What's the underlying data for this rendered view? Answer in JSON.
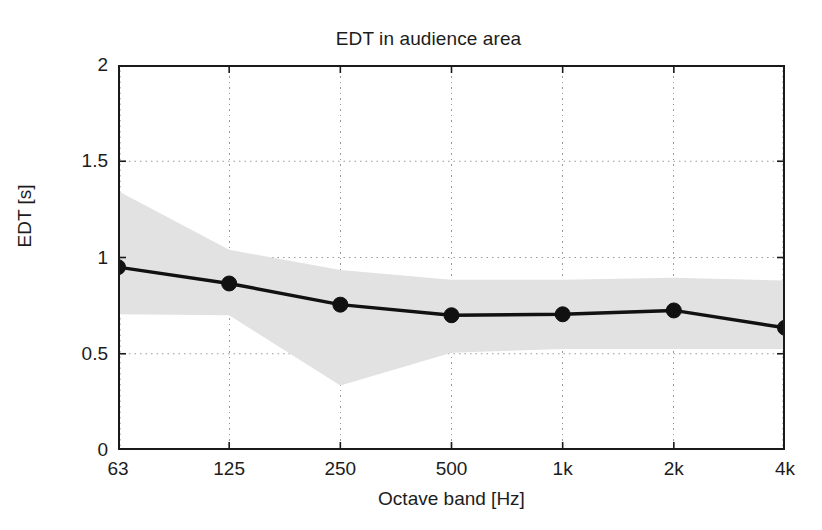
{
  "chart_data": {
    "type": "line",
    "title": "EDT in audience area",
    "xlabel": "Octave band [Hz]",
    "ylabel": "EDT [s]",
    "categories": [
      "63",
      "125",
      "250",
      "500",
      "1k",
      "2k",
      "4k"
    ],
    "x_tick_labels": [
      "63",
      "125",
      "250",
      "500",
      "1k",
      "2k",
      "4k"
    ],
    "y_tick_labels": [
      "0",
      "0.5",
      "1",
      "1.5",
      "2"
    ],
    "y_tick_values": [
      0,
      0.5,
      1,
      1.5,
      2
    ],
    "ylim": [
      0,
      2
    ],
    "grid": "dotted",
    "legend": "none",
    "series": [
      {
        "name": "EDT mean",
        "marker": "filled-circle",
        "color": "#111111",
        "values": [
          0.95,
          0.865,
          0.755,
          0.7,
          0.705,
          0.725,
          0.635
        ]
      }
    ],
    "band": {
      "name": "standard deviation range",
      "color": "#e2e2e2",
      "upper": [
        1.345,
        1.04,
        0.935,
        0.885,
        0.885,
        0.895,
        0.88
      ],
      "lower": [
        0.705,
        0.7,
        0.335,
        0.505,
        0.525,
        0.525,
        0.525
      ],
      "note": "shaded spread band around the mean EDT curve"
    }
  },
  "figure": {
    "background_color": "#ffffff",
    "axis_color": "#1a1a1a",
    "grid_color": "#9a9a9a"
  }
}
